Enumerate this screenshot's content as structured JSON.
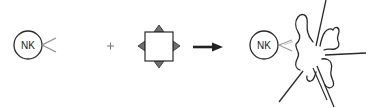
{
  "diagram": {
    "colors": {
      "stroke": "#2a2a2a",
      "receptor": "#888888",
      "ligand_fill": "#6e6e6e",
      "background": "#ffffff"
    },
    "nodes": [
      {
        "id": "nk-cell-left",
        "label": "NK",
        "shape": "circle",
        "receptor": "open-chevron"
      },
      {
        "id": "operator-plus",
        "label": "+"
      },
      {
        "id": "target-cell",
        "label": "",
        "shape": "square",
        "ligands": [
          "top",
          "right",
          "bottom",
          "left"
        ]
      },
      {
        "id": "reaction-arrow",
        "label": "",
        "shape": "arrow"
      },
      {
        "id": "nk-cell-right",
        "label": "NK",
        "shape": "circle",
        "receptor": "open-chevron"
      },
      {
        "id": "lysed-target-cell",
        "label": "",
        "shape": "exploding-blob"
      }
    ],
    "nk_left": {
      "label": "NK"
    },
    "plus": {
      "label": "+"
    },
    "nk_right": {
      "label": "NK"
    }
  }
}
